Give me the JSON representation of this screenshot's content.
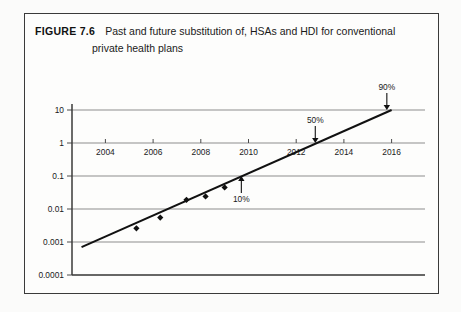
{
  "figure": {
    "label": "FIGURE 7.6",
    "caption_line_1": "Past and future substitution of, HSAs and HDI for conventional",
    "caption_line_2": "private health plans"
  },
  "chart_data": {
    "type": "scatter",
    "title": "Past and future substitution of, HSAs and HDI for conventional private health plans",
    "xlabel": "",
    "ylabel": "",
    "yscale": "log",
    "grid": true,
    "legend": "none",
    "xlim": [
      2002.6,
      2017.4
    ],
    "ylim": [
      0.0001,
      10
    ],
    "xticks": [
      2004,
      2006,
      2008,
      2010,
      2012,
      2014,
      2016
    ],
    "xtick_labels": [
      "2004",
      "2006",
      "2008",
      "2010",
      "2012",
      "2014",
      "2016"
    ],
    "yticks": [
      10,
      1,
      0.1,
      0.01,
      0.001,
      0.0001
    ],
    "ytick_labels": [
      "10",
      "1",
      "0.1",
      "0.01",
      "0.001",
      "0.0001"
    ],
    "series": [
      {
        "name": "observed",
        "type": "scatter",
        "marker": "diamond",
        "x": [
          2005.3,
          2006.3,
          2007.4,
          2008.2,
          2009.0
        ],
        "y": [
          0.0026,
          0.0055,
          0.019,
          0.024,
          0.045
        ]
      },
      {
        "name": "trend",
        "type": "line",
        "x": [
          2003.0,
          2016.0
        ],
        "y": [
          0.0007,
          10.0
        ]
      }
    ],
    "annotations": [
      {
        "label": "10%",
        "x": 2009.7,
        "y": 0.1,
        "arrow": "up"
      },
      {
        "label": "50%",
        "x": 2012.8,
        "y": 1.0,
        "arrow": "down"
      },
      {
        "label": "90%",
        "x": 2015.8,
        "y": 10.0,
        "arrow": "down"
      }
    ]
  },
  "colors": {
    "ink": "#111111",
    "gridline": "#8d8d8d",
    "border": "#3a3a3a",
    "paper": "#fdfdfc"
  }
}
